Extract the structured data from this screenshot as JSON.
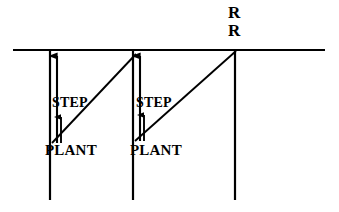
{
  "figure": {
    "background_color": "#ffffff",
    "stroke_color": "#000000"
  },
  "labels": {
    "step_1": "STEP",
    "step_2": "STEP",
    "plant_1": "PLANT",
    "plant_2": "PLANT",
    "r_top": "R",
    "r_bottom": "R"
  },
  "geometry": {
    "ground_line": {
      "x1": 13,
      "y1": 50,
      "x2": 325,
      "y2": 50
    },
    "verticals": [
      {
        "x": 50,
        "y1": 50,
        "y2": 200
      },
      {
        "x": 133,
        "y1": 50,
        "y2": 200
      },
      {
        "x": 235,
        "y1": 50,
        "y2": 200
      }
    ],
    "tall_arrows": [
      {
        "x": 57,
        "y_from": 143,
        "y_to": 55
      },
      {
        "x": 140,
        "y_from": 140,
        "y_to": 55
      }
    ],
    "short_arrows": [
      {
        "x": 58,
        "y_from": 143,
        "y_to": 116
      },
      {
        "x": 141,
        "y_from": 141,
        "y_to": 114
      }
    ],
    "diagonals": [
      {
        "x1": 52,
        "y1": 143,
        "x2": 136,
        "y2": 55
      },
      {
        "x1": 135,
        "y1": 141,
        "x2": 236,
        "y2": 52
      }
    ]
  },
  "label_positions": {
    "step_1": {
      "x": 52,
      "y": 96
    },
    "step_2": {
      "x": 136,
      "y": 96
    },
    "plant_1": {
      "x": 45,
      "y": 143
    },
    "plant_2": {
      "x": 130,
      "y": 143
    },
    "r_top": {
      "x": 228,
      "y": 4
    },
    "r_bottom": {
      "x": 228,
      "y": 22
    }
  }
}
